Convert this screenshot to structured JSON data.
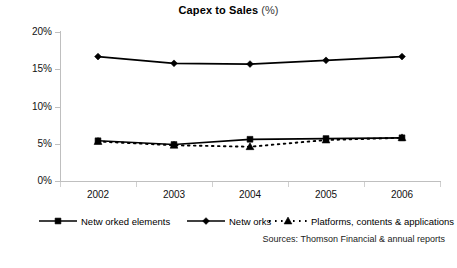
{
  "chart_data": {
    "type": "line",
    "title_main": "Capex to Sales",
    "title_unit": "(%)",
    "xlabel": "",
    "ylabel": "",
    "categories": [
      "2002",
      "2003",
      "2004",
      "2005",
      "2006"
    ],
    "ylim": [
      0,
      20
    ],
    "ytick_values": [
      0,
      5,
      10,
      15,
      20
    ],
    "ytick_labels": [
      "0%",
      "5%",
      "10%",
      "15%",
      "20%"
    ],
    "grid": false,
    "legend_position": "bottom",
    "series": [
      {
        "name": "Netw orked elements",
        "marker": "square",
        "line_style": "solid",
        "color": "#000000",
        "values": [
          5.4,
          4.9,
          5.6,
          5.7,
          5.8
        ]
      },
      {
        "name": "Netw orks",
        "marker": "diamond",
        "line_style": "solid",
        "color": "#000000",
        "values": [
          16.7,
          15.8,
          15.7,
          16.2,
          16.7
        ]
      },
      {
        "name": "Platforms, contents & applications",
        "marker": "triangle",
        "line_style": "dotted",
        "color": "#000000",
        "values": [
          5.3,
          4.8,
          4.6,
          5.5,
          5.8
        ]
      }
    ],
    "annotations": [
      "Sources: Thomson Financial & annual reports"
    ]
  },
  "footer": {
    "source": "Sources: Thomson Financial & annual reports"
  },
  "colors": {
    "ink": "#000000",
    "axis": "#bfbfbf",
    "tick": "#d0d0d0",
    "background": "#ffffff"
  }
}
